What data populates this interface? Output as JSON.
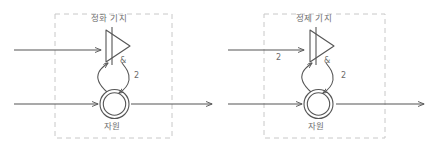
{
  "diagram": {
    "panels": [
      {
        "id": "left",
        "title": "정화 기지",
        "resource_label": "자원",
        "transition_icon": "triangle-bar-icon",
        "place_icon": "double-circle-icon",
        "amp_label": "&",
        "input_multiplicity": "",
        "feedback_multiplicity": "2",
        "box": {
          "x": 55,
          "y": 14,
          "w": 117,
          "h": 124
        }
      },
      {
        "id": "right",
        "title": "정제 기지",
        "resource_label": "자원",
        "transition_icon": "triangle-bar-icon",
        "place_icon": "double-circle-icon",
        "amp_label": "&",
        "input_multiplicity": "2",
        "feedback_multiplicity": "2",
        "box": {
          "x": 264,
          "y": 14,
          "w": 121,
          "h": 124
        }
      }
    ],
    "colors": {
      "line": "#555555",
      "dash": "#c8c8c8",
      "text": "#6b6b6b",
      "background": "#ffffff"
    }
  }
}
